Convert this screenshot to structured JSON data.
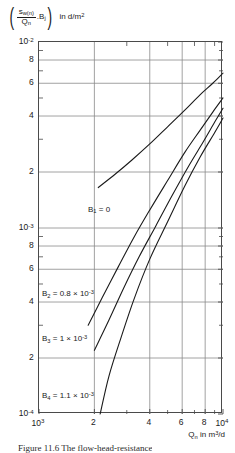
{
  "axis_labels": {
    "y_open_paren": "(",
    "y_num_s": "s",
    "y_num_sub": "w(n)",
    "y_den_q": "Q",
    "y_den_sub": "n",
    "y_mult_b": ".B",
    "y_mult_b_sub": "j",
    "y_close_paren": ")",
    "y_units_prefix": "in d/m",
    "y_units_sup": "2",
    "x_symbol": "Q",
    "x_symbol_sub": "n",
    "x_units_prefix": " in m",
    "x_units_sup": "3",
    "x_units_suffix": "/d"
  },
  "caption": "Figure 11.6  The flow-head-resistance",
  "chart_data": {
    "type": "line",
    "title": "",
    "xlabel": "Qn in m3/d",
    "ylabel": "(sw(n)/Qn . Bj) in d/m2",
    "xscale": "log",
    "yscale": "log",
    "xlim": [
      1000,
      10000
    ],
    "ylim": [
      0.0001,
      0.01
    ],
    "grid": true,
    "legend_position": "inline-annotations",
    "x_major_ticks": [
      {
        "value": 1000,
        "label_base": "10",
        "label_exp": "3"
      },
      {
        "value": 2000,
        "label_base": "2",
        "label_exp": ""
      },
      {
        "value": 4000,
        "label_base": "4",
        "label_exp": ""
      },
      {
        "value": 6000,
        "label_base": "6",
        "label_exp": ""
      },
      {
        "value": 8000,
        "label_base": "8",
        "label_exp": ""
      },
      {
        "value": 10000,
        "label_base": "10",
        "label_exp": "4"
      }
    ],
    "x_minor_ticks": [
      3000,
      5000,
      7000,
      9000
    ],
    "y_major_ticks": [
      {
        "value": 0.01,
        "label_base": "10",
        "label_exp": "-2"
      },
      {
        "value": 0.008,
        "label_base": "8",
        "label_exp": ""
      },
      {
        "value": 0.006,
        "label_base": "6",
        "label_exp": ""
      },
      {
        "value": 0.004,
        "label_base": "4",
        "label_exp": ""
      },
      {
        "value": 0.002,
        "label_base": "2",
        "label_exp": ""
      },
      {
        "value": 0.001,
        "label_base": "10",
        "label_exp": "-3"
      },
      {
        "value": 0.0008,
        "label_base": "8",
        "label_exp": ""
      },
      {
        "value": 0.0006,
        "label_base": "6",
        "label_exp": ""
      },
      {
        "value": 0.0004,
        "label_base": "4",
        "label_exp": ""
      },
      {
        "value": 0.0002,
        "label_base": "2",
        "label_exp": ""
      },
      {
        "value": 0.0001,
        "label_base": "10",
        "label_exp": "-4"
      }
    ],
    "y_minor_ticks": [
      0.009,
      0.007,
      0.005,
      0.003,
      0.0009,
      0.0007,
      0.0005,
      0.0003
    ],
    "series": [
      {
        "name": "B1",
        "annotation_base": "B",
        "annotation_sub": "1",
        "annotation_value": " = 0",
        "annotation_exp": "",
        "label_x": 88,
        "label_y": 205,
        "points": [
          [
            2100,
            0.00165
          ],
          [
            2600,
            0.00195
          ],
          [
            3200,
            0.00232
          ],
          [
            4000,
            0.00283
          ],
          [
            5000,
            0.0035
          ],
          [
            6200,
            0.0043
          ],
          [
            7500,
            0.0052
          ],
          [
            8800,
            0.006
          ],
          [
            10000,
            0.0068
          ]
        ]
      },
      {
        "name": "B2",
        "annotation_base": "B",
        "annotation_sub": "2",
        "annotation_value": " = 0.8 × 10",
        "annotation_exp": "-3",
        "label_x": 42,
        "label_y": 289,
        "points": [
          [
            1850,
            0.0003
          ],
          [
            2200,
            0.00042
          ],
          [
            2700,
            0.00062
          ],
          [
            3300,
            0.0009
          ],
          [
            4000,
            0.00125
          ],
          [
            5000,
            0.0018
          ],
          [
            6200,
            0.00255
          ],
          [
            7500,
            0.00335
          ],
          [
            8800,
            0.0042
          ],
          [
            10000,
            0.005
          ]
        ]
      },
      {
        "name": "B3",
        "annotation_base": "B",
        "annotation_sub": "3",
        "annotation_value": " = 1 × 10",
        "annotation_exp": "-3",
        "label_x": 42,
        "label_y": 334,
        "points": [
          [
            2000,
            0.00022
          ],
          [
            2400,
            0.00032
          ],
          [
            2900,
            0.00048
          ],
          [
            3500,
            0.0007
          ],
          [
            4300,
            0.00102
          ],
          [
            5300,
            0.0015
          ],
          [
            6500,
            0.00215
          ],
          [
            7800,
            0.0029
          ],
          [
            9000,
            0.0037
          ],
          [
            10000,
            0.0044
          ]
        ]
      },
      {
        "name": "B4",
        "annotation_base": "B",
        "annotation_sub": "4",
        "annotation_value": " = 1.1 × 10",
        "annotation_exp": "-3",
        "label_x": 42,
        "label_y": 391,
        "points": [
          [
            2150,
            0.0001
          ],
          [
            2400,
            0.00016
          ],
          [
            2800,
            0.00026
          ],
          [
            3300,
            0.00042
          ],
          [
            4000,
            0.00068
          ],
          [
            5000,
            0.00108
          ],
          [
            6200,
            0.00168
          ],
          [
            7500,
            0.0024
          ],
          [
            9000,
            0.00325
          ],
          [
            10000,
            0.0039
          ]
        ]
      }
    ]
  }
}
